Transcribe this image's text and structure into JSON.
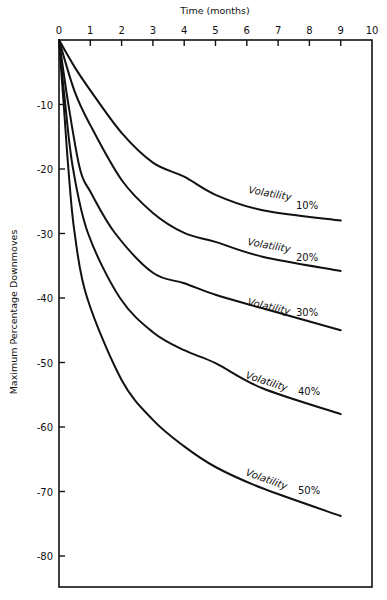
{
  "chart_data": {
    "type": "line",
    "title": "",
    "xlabel": "Time (months)",
    "ylabel": "Maximum Percentage Downmoves",
    "xlim": [
      0,
      10
    ],
    "ylim": [
      -85,
      0
    ],
    "x_axis_position": "top",
    "grid": false,
    "x_ticks": [
      0,
      1,
      2,
      3,
      4,
      5,
      6,
      7,
      8,
      9,
      10
    ],
    "y_ticks": [
      -10,
      -20,
      -30,
      -40,
      -50,
      -60,
      -70,
      -80
    ],
    "x_tick_labels": [
      "0",
      "1",
      "2",
      "3",
      "4",
      "5",
      "6",
      "7",
      "8",
      "9",
      "10"
    ],
    "y_tick_labels": [
      "-10",
      "-20",
      "-30",
      "-40",
      "-50",
      "-60",
      "-70",
      "-80"
    ],
    "series": [
      {
        "name": "Volatility 10%",
        "label_word": "Volatility",
        "label_pct": "10%",
        "x": [
          0,
          0.5,
          1,
          2,
          3,
          4,
          5,
          6.5,
          9
        ],
        "values": [
          0,
          -4.2,
          -7.8,
          -14.4,
          -19.0,
          -21.2,
          -24.0,
          -26.4,
          -28.0
        ]
      },
      {
        "name": "Volatility 20%",
        "label_word": "Volatility",
        "label_pct": "20%",
        "x": [
          0,
          0.5,
          1,
          2,
          3,
          4,
          5,
          6.5,
          9
        ],
        "values": [
          0,
          -8.0,
          -13.2,
          -21.7,
          -26.8,
          -29.9,
          -31.3,
          -33.6,
          -35.8
        ]
      },
      {
        "name": "Volatility 30%",
        "label_word": "Volatility",
        "label_pct": "30%",
        "x": [
          0,
          0.3,
          0.67,
          1,
          1.8,
          3,
          4,
          5,
          6.5,
          9
        ],
        "values": [
          0,
          -10.0,
          -20.0,
          -23.5,
          -30.0,
          -36.1,
          -37.7,
          -39.5,
          -41.6,
          -45.0
        ]
      },
      {
        "name": "Volatility 40%",
        "label_word": "Volatility",
        "label_pct": "40%",
        "x": [
          0,
          0.2,
          0.45,
          0.93,
          1.95,
          3,
          4,
          5,
          6.5,
          9
        ],
        "values": [
          0,
          -10.0,
          -20.0,
          -30.0,
          -40.0,
          -45.3,
          -48.1,
          -50.1,
          -54.0,
          -58.0
        ]
      },
      {
        "name": "Volatility 50%",
        "label_word": "Volatility",
        "label_pct": "50%",
        "x": [
          0,
          0.15,
          0.3,
          0.5,
          0.9,
          2,
          3,
          4,
          5,
          6.5,
          9
        ],
        "values": [
          0,
          -10.0,
          -20.0,
          -30.0,
          -40.0,
          -52.7,
          -58.9,
          -63.0,
          -66.2,
          -69.5,
          -73.8
        ]
      }
    ],
    "annotations": [
      {
        "text": "Volatility 10%",
        "near_x": 7.5,
        "near_y": -26
      },
      {
        "text": "Volatility 20%",
        "near_x": 7.5,
        "near_y": -33
      },
      {
        "text": "Volatility 30%",
        "near_x": 7.5,
        "near_y": -42
      },
      {
        "text": "Volatility 40%",
        "near_x": 7.5,
        "near_y": -54
      },
      {
        "text": "Volatility 50%",
        "near_x": 7.5,
        "near_y": -70
      }
    ]
  }
}
